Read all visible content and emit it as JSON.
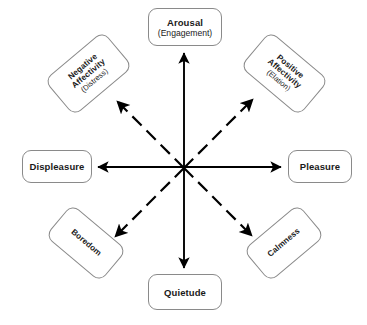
{
  "diagram": {
    "background_color": "#ffffff",
    "center": {
      "x": 184,
      "y": 168
    },
    "node_border_color": "#8a8a8a",
    "line_color": "#000000",
    "nodes": [
      {
        "id": "arousal",
        "position": "top",
        "primary": "Arousal",
        "secondary": "(Engagement)",
        "rotation_deg": 0
      },
      {
        "id": "positive-affectivity",
        "position": "top-right",
        "primary": "Positive",
        "primary2": "Affectivity",
        "secondary": "(Elation)",
        "rotation_deg": 40
      },
      {
        "id": "pleasure",
        "position": "right",
        "primary": "Pleasure",
        "secondary": "",
        "rotation_deg": 0
      },
      {
        "id": "calmness",
        "position": "bottom-right",
        "primary": "Calmness",
        "secondary": "",
        "rotation_deg": -40
      },
      {
        "id": "quietude",
        "position": "bottom",
        "primary": "Quietude",
        "secondary": "",
        "rotation_deg": 0
      },
      {
        "id": "boredom",
        "position": "bottom-left",
        "primary": "Boredom",
        "secondary": "",
        "rotation_deg": 40
      },
      {
        "id": "displeasure",
        "position": "left",
        "primary": "Displeasure",
        "secondary": "",
        "rotation_deg": 0
      },
      {
        "id": "negative-affectivity",
        "position": "top-left",
        "primary": "Negative",
        "primary2": "Affectivity",
        "secondary": "(Distress)",
        "rotation_deg": -40
      }
    ],
    "arrows": [
      {
        "id": "arrow-up",
        "target": "arousal",
        "style": "solid",
        "direction": "up"
      },
      {
        "id": "arrow-down",
        "target": "quietude",
        "style": "solid",
        "direction": "down"
      },
      {
        "id": "arrow-left",
        "target": "displeasure",
        "style": "solid",
        "direction": "left"
      },
      {
        "id": "arrow-right",
        "target": "pleasure",
        "style": "solid",
        "direction": "right"
      },
      {
        "id": "arrow-up-left",
        "target": "negative-affectivity",
        "style": "dashed",
        "direction": "up-left"
      },
      {
        "id": "arrow-up-right",
        "target": "positive-affectivity",
        "style": "dashed",
        "direction": "up-right"
      },
      {
        "id": "arrow-down-left",
        "target": "boredom",
        "style": "dashed",
        "direction": "down-left"
      },
      {
        "id": "arrow-down-right",
        "target": "calmness",
        "style": "dashed",
        "direction": "down-right"
      }
    ]
  }
}
